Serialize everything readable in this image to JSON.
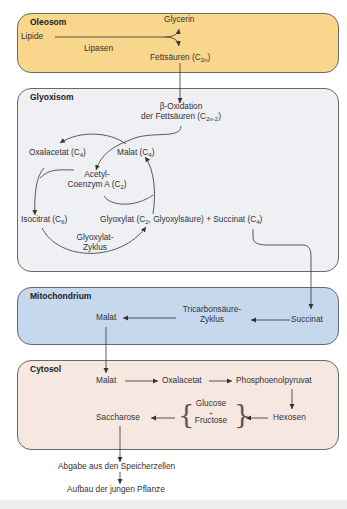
{
  "diagram": {
    "colors": {
      "oleosom": "#f8d68c",
      "glyoxisom": "#eef0f3",
      "mitochondrium": "#c5d8ee",
      "cytosol": "#f6e7e0",
      "border": "#6a6a6a",
      "arrow": "#333333"
    },
    "oleosom": {
      "title": "Oleosom",
      "lipide": "Lipide",
      "lipasen": "Lipasen",
      "glycerin": "Glycerin",
      "fettsaeuren": "Fettsäuren (C",
      "fettsaeuren_sub": "2n",
      "fettsaeuren_end": ")"
    },
    "glyoxisom": {
      "title": "Glyoxisom",
      "beta_oxidation_1": "β-Oxidation",
      "beta_oxidation_2": "der Fettsäuren (C",
      "beta_oxidation_sub": "2n-2",
      "beta_oxidation_end": ")",
      "oxalacetat": "Oxalacetat (C",
      "oxalacetat_sub": "4",
      "malat": "Malat (C",
      "malat_sub": "4",
      "acetyl_1": "Acetyl-",
      "acetyl_2": "Coenzym A (C",
      "acetyl_sub": "2",
      "isocitrat": "Isocitrat (C",
      "isocitrat_sub": "6",
      "glyoxylat": "Glyoxylat (C",
      "glyoxylat_sub": "2",
      "glyoxylat_rest": ", Glyoxylsäure) + Succinat (C",
      "succinat_sub": "4",
      "cycle_1": "Glyoxylat-",
      "cycle_2": "Zyklus",
      "close": ")"
    },
    "mitochondrium": {
      "title": "Mitochondrium",
      "malat": "Malat",
      "tca_1": "Tricarbonsäure-",
      "tca_2": "Zyklus",
      "succinat": "Succinat"
    },
    "cytosol": {
      "title": "Cytosol",
      "malat": "Malat",
      "oxalacetat": "Oxalacetat",
      "pep": "Phosphoenolpyruvat",
      "hexosen": "Hexosen",
      "glucose": "Glucose",
      "plus": "+",
      "fructose": "Fructose",
      "saccharose": "Saccharose"
    },
    "outside": {
      "abgabe": "Abgabe aus den Speicherzellen",
      "aufbau": "Aufbau der jungen Pflanze"
    }
  }
}
